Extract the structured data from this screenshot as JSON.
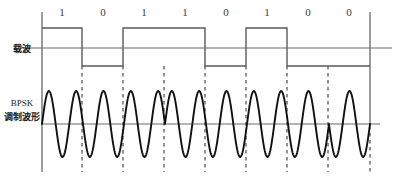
{
  "figure": {
    "background_color": "#ffffff",
    "line_color": "#5a5a5a",
    "wave_color": "#111111",
    "dash_color": "#3a3a3a",
    "text_color": "#1c1c1c"
  },
  "labels": {
    "carrier": "载波",
    "bpsk_line1": "BPSK",
    "bpsk_line2": "调制波形"
  },
  "chart_data": {
    "type": "line",
    "title": "BPSK 调制波形",
    "xlabel": "",
    "ylabel": "",
    "bit_sequence": [
      1,
      0,
      1,
      1,
      0,
      1,
      0,
      0
    ],
    "bit_labels": [
      "1",
      "0",
      "1",
      "1",
      "0",
      "1",
      "0",
      "0"
    ],
    "bit_count": 8,
    "bit_width_px": 41,
    "x_start_px": 42,
    "x_end_px": 370,
    "series": [
      {
        "name": "载波",
        "type": "square",
        "high_y_px": 28,
        "zero_y_px": 48,
        "low_y_px": 66,
        "values": [
          1,
          0,
          1,
          1,
          0,
          1,
          0,
          0
        ]
      },
      {
        "name": "BPSK 调制波形",
        "type": "sinusoid",
        "zero_y_px": 124,
        "amplitude_px": 33,
        "cycles_per_bit": 1.5,
        "phase_by_bit_deg": [
          0,
          180,
          0,
          0,
          180,
          0,
          180,
          180
        ]
      }
    ],
    "boundary_x_px": [
      82,
      123,
      164,
      205,
      246,
      287,
      328,
      370
    ],
    "grid": false,
    "legend": "none"
  }
}
